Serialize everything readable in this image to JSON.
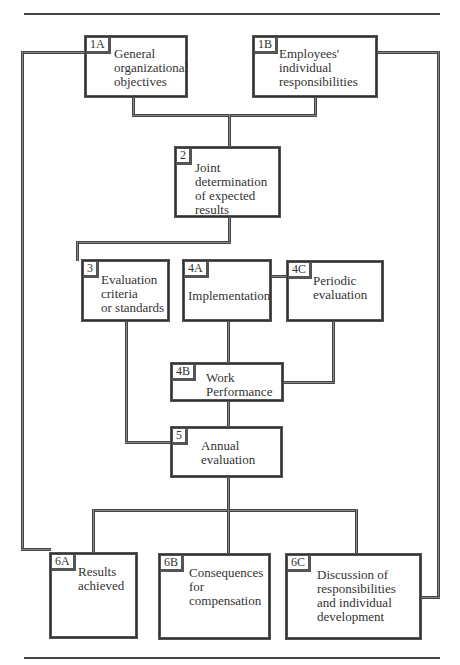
{
  "diagram": {
    "nodes": [
      {
        "id": "1A",
        "label": "General\norganizational\nobjectives"
      },
      {
        "id": "1B",
        "label": "Employees'\nindividual\nresponsibilities"
      },
      {
        "id": "2",
        "label": "Joint\ndetermination\nof expected\nresults"
      },
      {
        "id": "3",
        "label": "Evaluation\ncriteria\nor standards"
      },
      {
        "id": "4A",
        "label": "Implementation"
      },
      {
        "id": "4C",
        "label": "Periodic\nevaluation"
      },
      {
        "id": "4B",
        "label": "Work\nPerformance"
      },
      {
        "id": "5",
        "label": "Annual\nevaluation"
      },
      {
        "id": "6A",
        "label": "Results\nachieved"
      },
      {
        "id": "6B",
        "label": "Consequences\nfor\ncompensation"
      },
      {
        "id": "6C",
        "label": "Discussion of\nresponsibilities\nand individual\ndevelopment"
      }
    ],
    "edges": [
      [
        "1A",
        "2"
      ],
      [
        "1B",
        "2"
      ],
      [
        "2",
        "3"
      ],
      [
        "2",
        "4A"
      ],
      [
        "4A",
        "4C"
      ],
      [
        "4A",
        "4B"
      ],
      [
        "4C",
        "4B"
      ],
      [
        "3",
        "5"
      ],
      [
        "4B",
        "5"
      ],
      [
        "5",
        "6A"
      ],
      [
        "5",
        "6B"
      ],
      [
        "5",
        "6C"
      ],
      [
        "1A",
        "6A"
      ],
      [
        "1B",
        "6C"
      ]
    ]
  }
}
